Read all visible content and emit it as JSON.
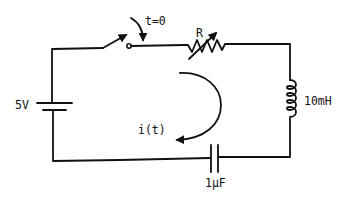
{
  "diagram": {
    "type": "series RLC circuit with switch",
    "components": {
      "source": {
        "label": "5V",
        "kind": "dc-voltage-source"
      },
      "switch": {
        "label": "t=0",
        "kind": "switch-closes-at-t0"
      },
      "resistor": {
        "label": "R",
        "kind": "variable-resistor"
      },
      "inductor": {
        "label": "10mH",
        "kind": "inductor"
      },
      "capacitor": {
        "label": "1μF",
        "kind": "capacitor"
      }
    },
    "current": {
      "label": "i(t)",
      "direction": "clockwise-arc-arrow"
    }
  },
  "colors": {
    "line": "#111111",
    "background": "#ffffff"
  }
}
